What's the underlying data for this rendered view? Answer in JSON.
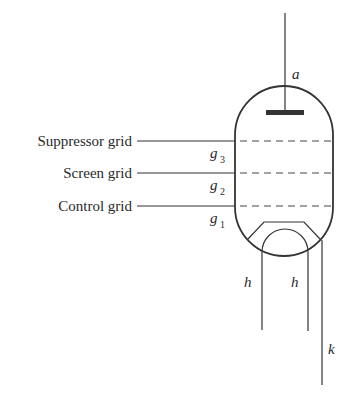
{
  "diagram": {
    "labels": {
      "suppressor_grid": "Suppressor grid",
      "screen_grid": "Screen grid",
      "control_grid": "Control grid"
    },
    "symbols": {
      "anode": "a",
      "g": "g",
      "g3_sub": "3",
      "g2_sub": "2",
      "g1_sub": "1",
      "heater_left": "h",
      "heater_right": "h",
      "cathode": "k"
    },
    "colors": {
      "line": "#333333",
      "text": "#2a2a2a",
      "background": "#ffffff"
    }
  }
}
